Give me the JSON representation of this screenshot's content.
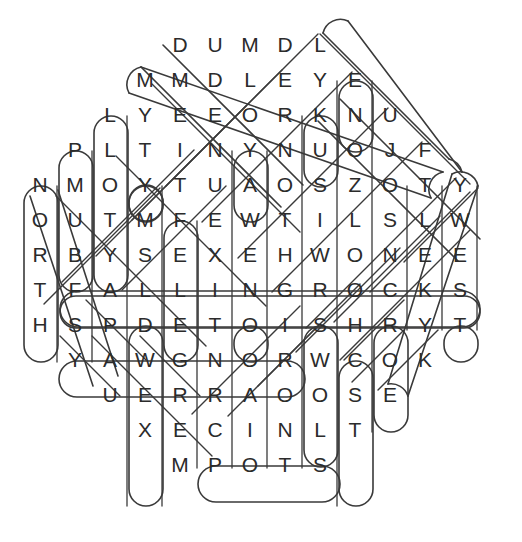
{
  "puzzle": {
    "type": "word-search",
    "title": "",
    "grid_cols": 13,
    "grid_rows": 13,
    "cell_size": 35,
    "origin_x": 40,
    "origin_y": 45,
    "letter_color": "#2b2b2b",
    "marker_color": "#3a3a3a",
    "background_color": "#ffffff",
    "rows": [
      {
        "row": 1,
        "start_col": 5,
        "letters": [
          "D",
          "U",
          "M",
          "D",
          "L"
        ]
      },
      {
        "row": 2,
        "start_col": 4,
        "letters": [
          "M",
          "M",
          "D",
          "L",
          "E",
          "Y",
          "E"
        ]
      },
      {
        "row": 3,
        "start_col": 3,
        "letters": [
          "L",
          "Y",
          "E",
          "E",
          "O",
          "R",
          "K",
          "N",
          "U"
        ]
      },
      {
        "row": 4,
        "start_col": 2,
        "letters": [
          "P",
          "L",
          "T",
          "I",
          "N",
          "Y",
          "N",
          "U",
          "O",
          "J",
          "F"
        ]
      },
      {
        "row": 5,
        "start_col": 1,
        "letters": [
          "N",
          "M",
          "O",
          "Y",
          "T",
          "U",
          "A",
          "O",
          "S",
          "Z",
          "O",
          "T",
          "Y"
        ]
      },
      {
        "row": 6,
        "start_col": 1,
        "letters": [
          "O",
          "U",
          "T",
          "M",
          "F",
          "E",
          "W",
          "T",
          "I",
          "L",
          "S",
          "L",
          "W"
        ]
      },
      {
        "row": 7,
        "start_col": 1,
        "letters": [
          "R",
          "B",
          "Y",
          "S",
          "E",
          "X",
          "E",
          "H",
          "W",
          "O",
          "N",
          "E",
          "E"
        ]
      },
      {
        "row": 8,
        "start_col": 1,
        "letters": [
          "T",
          "F",
          "A",
          "L",
          "L",
          "I",
          "N",
          "G",
          "R",
          "O",
          "C",
          "K",
          "S"
        ]
      },
      {
        "row": 9,
        "start_col": 1,
        "letters": [
          "H",
          "S",
          "P",
          "D",
          "E",
          "T",
          "O",
          "I",
          "S",
          "H",
          "R",
          "Y",
          "T"
        ]
      },
      {
        "row": 10,
        "start_col": 2,
        "letters": [
          "Y",
          "A",
          "W",
          "G",
          "N",
          "O",
          "R",
          "W",
          "C",
          "O",
          "K"
        ]
      },
      {
        "row": 11,
        "start_col": 3,
        "letters": [
          "U",
          "E",
          "R",
          "R",
          "A",
          "O",
          "O",
          "S",
          "E"
        ]
      },
      {
        "row": 12,
        "start_col": 4,
        "letters": [
          "X",
          "E",
          "C",
          "I",
          "N",
          "L",
          "T"
        ]
      },
      {
        "row": 13,
        "start_col": 5,
        "letters": [
          "M",
          "P",
          "O",
          "T",
          "S"
        ]
      }
    ],
    "found_words": [
      {
        "text": "FALLINGROCKS",
        "direction": "horizontal",
        "row": 8,
        "start_col": 2,
        "end_col": 13
      },
      {
        "text": "YAWGNORW",
        "direction": "horizontal",
        "row": 10,
        "start_col": 2,
        "end_col": 9
      },
      {
        "text": "POTS",
        "direction": "horizontal",
        "row": 13,
        "start_col": 6,
        "end_col": 9
      },
      {
        "text": "MMDLEYE-diag",
        "direction": "diagonal",
        "row": 2,
        "start_col": 4,
        "end_col": 10
      },
      {
        "text": "vertical-L-T",
        "direction": "vertical",
        "row": 3,
        "start_col": 3,
        "end_col": 3
      },
      {
        "text": "vertical-P-B",
        "direction": "vertical",
        "row": 4,
        "start_col": 2,
        "end_col": 2
      },
      {
        "text": "vertical-N-T",
        "direction": "vertical",
        "row": 5,
        "start_col": 1,
        "end_col": 1
      },
      {
        "text": "vertical-E-T",
        "direction": "vertical",
        "row": 6,
        "start_col": 6,
        "end_col": 6
      },
      {
        "text": "vertical-T-O",
        "direction": "vertical",
        "row": 9,
        "start_col": 6,
        "end_col": 6
      },
      {
        "text": "vertical-E-M",
        "direction": "vertical",
        "row": 9,
        "start_col": 5,
        "end_col": 5
      },
      {
        "text": "vertical-W-S",
        "direction": "vertical",
        "row": 10,
        "start_col": 9,
        "end_col": 9
      },
      {
        "text": "vertical-H-S",
        "direction": "vertical",
        "row": 9,
        "start_col": 10,
        "end_col": 10
      },
      {
        "text": "vertical-K-U",
        "direction": "vertical",
        "row": 3,
        "start_col": 9,
        "end_col": 9
      },
      {
        "text": "vertical-Y-N",
        "direction": "vertical",
        "row": 4,
        "start_col": 7,
        "end_col": 7
      },
      {
        "text": "vertical-T-O",
        "direction": "vertical",
        "row": 9,
        "start_col": 7,
        "end_col": 7
      },
      {
        "text": "vertical-N-C",
        "direction": "vertical",
        "row": 12,
        "start_col": 8,
        "end_col": 8
      },
      {
        "text": "vertical-T-T",
        "direction": "vertical",
        "row": 9,
        "start_col": 13,
        "end_col": 13
      }
    ]
  }
}
